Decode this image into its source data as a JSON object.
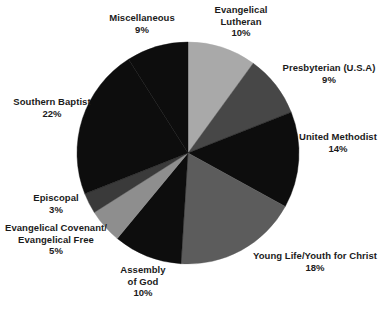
{
  "chart_data": {
    "type": "pie",
    "title": "",
    "subtitle": "",
    "xlabel": "",
    "ylabel": "",
    "legend_position": "none",
    "grid": false,
    "labels_inline": false,
    "start_angle_deg": 0,
    "direction": "clockwise",
    "unit": "%",
    "center": {
      "cx": 188,
      "cy": 153,
      "r": 111
    },
    "categories": [
      "Evangelical Lutheran",
      "Presbyterian (U.S.A)",
      "United Methodist",
      "Young Life/Youth for Christ",
      "Assembly of God",
      "Evangelical Covenant/ Evangelical Free",
      "Episcopal",
      "Southern Baptist",
      "Miscellaneous"
    ],
    "values": [
      10,
      9,
      14,
      18,
      10,
      5,
      3,
      22,
      9
    ],
    "colors": [
      "#a9a9a9",
      "#474747",
      "#0d0d0d",
      "#5c5c5c",
      "#0d0d0d",
      "#8e8e8e",
      "#3a3a3a",
      "#0d0d0d",
      "#0d0d0d"
    ],
    "slices": [
      {
        "label": "Evangelical Lutheran",
        "value": 10,
        "display": "10%",
        "color": "#a9a9a9"
      },
      {
        "label": "Presbyterian (U.S.A)",
        "value": 9,
        "display": "9%",
        "color": "#474747"
      },
      {
        "label": "United Methodist",
        "value": 14,
        "display": "14%",
        "color": "#0d0d0d"
      },
      {
        "label": "Young Life/Youth for Christ",
        "value": 18,
        "display": "18%",
        "color": "#5c5c5c"
      },
      {
        "label": "Assembly of God",
        "value": 10,
        "display": "10%",
        "color": "#0d0d0d"
      },
      {
        "label": "Evangelical Covenant/ Evangelical Free",
        "value": 5,
        "display": "5%",
        "color": "#8e8e8e"
      },
      {
        "label": "Episcopal",
        "value": 3,
        "display": "3%",
        "color": "#3a3a3a"
      },
      {
        "label": "Southern Baptist",
        "value": 22,
        "display": "22%",
        "color": "#0d0d0d"
      },
      {
        "label": "Miscellaneous",
        "value": 9,
        "display": "9%",
        "color": "#0d0d0d"
      }
    ]
  },
  "callouts": {
    "miscellaneous": {
      "line1": "Miscellaneous",
      "value": "9%"
    },
    "lutheran": {
      "line1": "Evangelical",
      "line2": "Lutheran",
      "value": "10%"
    },
    "presbyterian": {
      "line1": "Presbyterian (U.S.A)",
      "value": "9%"
    },
    "methodist": {
      "line1": "United Methodist",
      "value": "14%"
    },
    "younglife": {
      "line1": "Young Life/Youth for Christ",
      "value": "18%"
    },
    "assembly": {
      "line1": "Assembly",
      "line2": "of God",
      "value": "10%"
    },
    "covenant": {
      "line1": "Evangelical Covenant/",
      "line2": "Evangelical Free",
      "value": "5%"
    },
    "episcopal": {
      "line1": "Episcopal",
      "value": "3%"
    },
    "baptist": {
      "line1": "Southern Baptist",
      "value": "22%"
    }
  }
}
